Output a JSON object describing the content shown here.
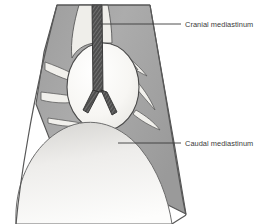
{
  "figure": {
    "background_color": "#ffffff"
  },
  "labels": [
    {
      "id": "cranial",
      "text": "Cranial mediastinum",
      "leader_from_x": 100,
      "leader_from_y": 24,
      "leader_to_x": 181,
      "leader_to_y": 24,
      "text_x": 185,
      "text_y": 26.5
    },
    {
      "id": "caudal",
      "text": "Caudal mediastinum",
      "leader_from_x": 118,
      "leader_from_y": 143,
      "leader_to_x": 181,
      "leader_to_y": 143,
      "text_x": 185,
      "text_y": 145.5
    }
  ],
  "structures": {
    "thorax_wall": {
      "name": "thorax-outline",
      "fill": "#ffffff",
      "stroke": "#5a5a5a"
    },
    "lung_field": {
      "name": "lung-field",
      "fill": "#a6a6a6",
      "stroke": "#555555"
    },
    "heart": {
      "name": "heart",
      "fill": "#f6f5f2",
      "stroke": "#4a4a4a",
      "center_x": 103,
      "center_y": 87,
      "radius_x": 36,
      "radius_y": 44
    },
    "trachea": {
      "name": "trachea",
      "fill": "#4a4a4a",
      "stroke": "#2e2e2e",
      "hatch_color": "#8d8d8d",
      "top_y": 6,
      "bifurcation_y": 96
    },
    "diaphragm": {
      "name": "diaphragm",
      "fill_top": "#dedede",
      "fill_bottom": "#fcfcfc",
      "stroke": "#6a6a6a"
    },
    "lung_lobes": {
      "name": "lung-lobe-fissures",
      "fill": "#f2f1ee",
      "stroke": "#5a5a5a"
    },
    "mediastinal_reflection": {
      "name": "mediastinal-reflection",
      "fill": "#e9e8e4",
      "stroke": "#5a5a5a"
    }
  },
  "leader_line": {
    "color": "#3a3a3a",
    "width": 0.9
  }
}
